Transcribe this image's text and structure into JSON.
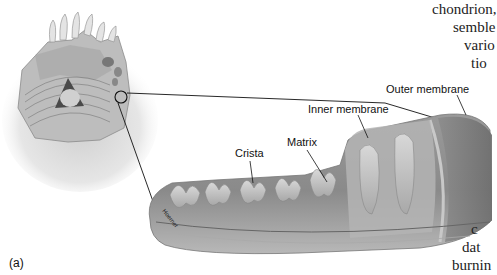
{
  "figure": {
    "panel_label": "(a)",
    "artist_credit": "Hoerner",
    "labels": {
      "outer_membrane": "Outer membrane",
      "inner_membrane": "Inner membrane",
      "matrix": "Matrix",
      "crista": "Crista"
    }
  },
  "body_text": {
    "top_right": [
      "chondrion,",
      "semble",
      "vario",
      "tio"
    ],
    "bottom_right": [
      "c",
      "dat",
      "burnin"
    ]
  }
}
